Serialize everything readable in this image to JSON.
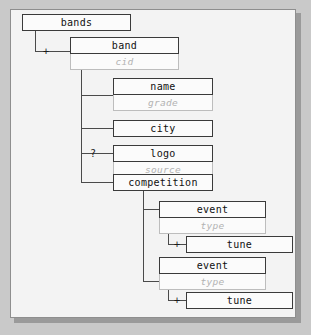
{
  "diagram": {
    "type": "xml-schema-tree",
    "title": "bands",
    "nodes": [
      {
        "id": "bands",
        "label": "bands",
        "attribute": null,
        "marker": null
      },
      {
        "id": "band",
        "label": "band",
        "attribute": "cid",
        "marker": "+"
      },
      {
        "id": "name",
        "label": "name",
        "attribute": "grade",
        "marker": null
      },
      {
        "id": "city",
        "label": "city",
        "attribute": null,
        "marker": null
      },
      {
        "id": "logo",
        "label": "logo",
        "attribute": "source",
        "marker": "?"
      },
      {
        "id": "competition",
        "label": "competition",
        "attribute": null,
        "marker": null
      },
      {
        "id": "event1",
        "label": "event",
        "attribute": "type",
        "marker": null
      },
      {
        "id": "tune1",
        "label": "tune",
        "attribute": null,
        "marker": "+"
      },
      {
        "id": "event2",
        "label": "event",
        "attribute": "type",
        "marker": null
      },
      {
        "id": "tune2",
        "label": "tune",
        "attribute": null,
        "marker": "+"
      }
    ],
    "colors": {
      "page_background": "#c9c9c9",
      "canvas_background": "#f3f3f3",
      "node_border": "#3a3a3a",
      "attribute_border": "#bdbdbd",
      "attribute_text": "#b3b3b3",
      "connector": "#4a4a4a"
    }
  }
}
